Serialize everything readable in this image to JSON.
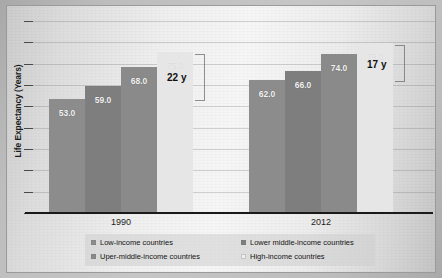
{
  "chart_data": {
    "type": "bar",
    "title": "",
    "subtitle": "",
    "xlabel": "",
    "ylabel": "Life Expectancy (Years)",
    "categories": [
      "1990",
      "2012"
    ],
    "ylim": [
      0,
      90
    ],
    "grid": true,
    "grid_axis": "y",
    "legend_position": "bottom",
    "axis_tick_labels": [],
    "series": [
      {
        "name": "Low-income countries",
        "values": [
          53.0,
          62.0
        ],
        "color": "#8c8c8c",
        "labels": [
          "53.0",
          "62.0"
        ]
      },
      {
        "name": "Lower middle-income countries",
        "values": [
          59.0,
          66.0
        ],
        "color": "#7e7e7e",
        "labels": [
          "59.0",
          "66.0"
        ]
      },
      {
        "name": "Uper-middle-income countries",
        "values": [
          68.0,
          74.0
        ],
        "color": "#8a8a8a",
        "labels": [
          "68.0",
          "74.0"
        ]
      },
      {
        "name": "High-income countries",
        "values": [
          75.0,
          79.0
        ],
        "color": "#e6e6e6",
        "labels": [
          "75.0",
          "79.0"
        ]
      }
    ],
    "annotations": [
      {
        "name": "gap-1990",
        "text": "22 y",
        "group": "1990",
        "from_value": 53.0,
        "to_value": 75.0
      },
      {
        "name": "gap-2012",
        "text": "17 y",
        "group": "2012",
        "from_value": 62.0,
        "to_value": 79.0
      }
    ]
  },
  "legend": {
    "items": [
      {
        "label": "Low-income countries",
        "color": "#8c8c8c"
      },
      {
        "label": "Lower middle-income countries",
        "color": "#7e7e7e"
      },
      {
        "label": "Uper-middle-income countries",
        "color": "#8a8a8a"
      },
      {
        "label": "High-income countries",
        "color": "#eeeeee"
      }
    ]
  }
}
